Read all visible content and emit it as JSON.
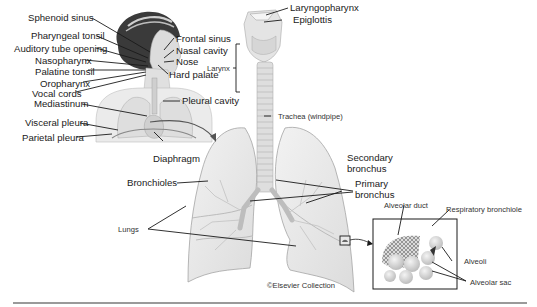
{
  "diagram": {
    "copyright": "©Elsevier Collection",
    "upper_airway_labels": {
      "sphenoid_sinus": "Sphenoid sinus",
      "pharyngeal_tonsil": "Pharyngeal tonsil",
      "auditory_tube_opening": "Auditory tube opening",
      "nasopharynx": "Nasopharynx",
      "palatine_tonsil": "Palatine tonsil",
      "oropharynx": "Oropharynx",
      "vocal_cords": "Vocal cords",
      "frontal_sinus": "Frontal sinus",
      "nasal_cavity": "Nasal cavity",
      "nose": "Nose",
      "hard_palate": "Hard palate"
    },
    "thorax_labels": {
      "mediastinum": "Mediastinum",
      "pleural_cavity": "Pleural cavity",
      "visceral_pleura": "Visceral pleura",
      "parietal_pleura": "Parietal pleura",
      "diaphragm": "Diaphragm"
    },
    "larynx_labels": {
      "laryngopharynx": "Laryngopharynx",
      "epiglottis": "Epiglottis",
      "larynx": "Larynx",
      "trachea": "Trachea (windpipe)"
    },
    "lung_labels": {
      "bronchioles": "Bronchioles",
      "secondary_bronchus": "Secondary bronchus",
      "secondary_bronchus_line1": "Secondary",
      "secondary_bronchus_line2": "bronchus",
      "primary_bronchus_line1": "Primary",
      "primary_bronchus_line2": "bronchus",
      "lungs": "Lungs"
    },
    "alveoli_labels": {
      "alveolar_duct": "Alveolar duct",
      "respiratory_bronchiole": "Respiratory bronchiole",
      "alveoli": "Alveoli",
      "alveolar_sac": "Alveolar sac"
    },
    "colors": {
      "line": "#1a1a1a",
      "tissue": "#e6e6e6",
      "tissue_stroke": "#9a9a9a",
      "hair": "#3a3a3a",
      "rule": "#9a9a9a"
    }
  }
}
